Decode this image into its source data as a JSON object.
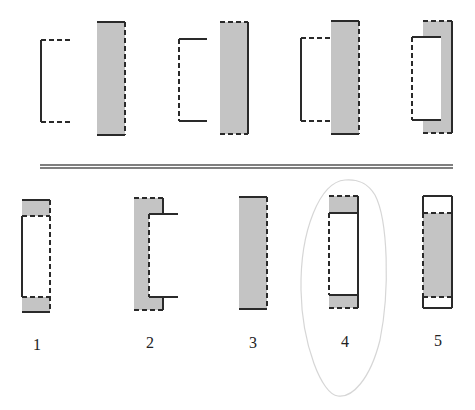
{
  "puzzle": {
    "type": "figure-sequence-reasoning",
    "colors": {
      "fill": "#c4c4c4",
      "stroke": "#2a2a2a",
      "background": "#ffffff",
      "separator": "#555555",
      "annotation": "#d6d6d6"
    },
    "question_figures": [
      {
        "id": "q1",
        "desc": "open bracket: solid left edge, dashed top and bottom edges"
      },
      {
        "id": "q2",
        "desc": "gray rectangle: solid top and bottom, dashed right edge"
      },
      {
        "id": "q3",
        "desc": "open bracket: dashed left edge, solid top and bottom edges"
      },
      {
        "id": "q4",
        "desc": "gray rectangle: dashed top and bottom, solid right edge"
      },
      {
        "id": "q5",
        "desc": "bracket q1 joined to gray rectangle q2"
      },
      {
        "id": "q6",
        "desc": "bracket q3 overlapping gray rectangle q4"
      }
    ],
    "options": [
      {
        "label": "1",
        "desc": "gray top/bottom bands, white middle with solid left and dashed right"
      },
      {
        "label": "2",
        "desc": "gray C-shape with solid side tabs extending right"
      },
      {
        "label": "3",
        "desc": "gray rectangle: solid top and bottom, dashed right"
      },
      {
        "label": "4",
        "desc": "gray top/bottom bands, white middle with dashed left and solid right",
        "circled": true
      },
      {
        "label": "5",
        "desc": "white top/bottom bands, gray middle"
      }
    ],
    "annotation": {
      "circled_option": "4"
    }
  }
}
